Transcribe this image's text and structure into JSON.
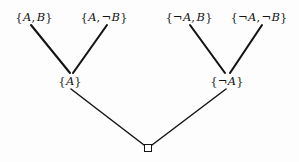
{
  "diagram": {
    "type": "tree",
    "title": "",
    "background_color": "#fdfdfd",
    "line_color": "#141414",
    "text_color": "#131313",
    "nodes": [
      {
        "id": "ab",
        "level": "top",
        "text": "{A, B}",
        "parts": {
          "open": "{",
          "first": "A",
          "first_neg": "",
          "comma": ",",
          "second": "B",
          "second_neg": "",
          "close": "}"
        },
        "x": 34,
        "y": 17
      },
      {
        "id": "anotb",
        "level": "top",
        "text": "{A, ¬B}",
        "parts": {
          "open": "{",
          "first": "A",
          "first_neg": "",
          "comma": ",",
          "second": "B",
          "second_neg": "¬",
          "close": "}"
        },
        "x": 104,
        "y": 17
      },
      {
        "id": "notab",
        "level": "top",
        "text": "{¬A, B}",
        "parts": {
          "open": "{",
          "first": "A",
          "first_neg": "¬",
          "comma": ",",
          "second": "B",
          "second_neg": "",
          "close": "}"
        },
        "x": 189,
        "y": 17
      },
      {
        "id": "notanotb",
        "level": "top",
        "text": "{¬A, ¬B}",
        "parts": {
          "open": "{",
          "first": "A",
          "first_neg": "¬",
          "comma": ",",
          "second": "B",
          "second_neg": "¬",
          "close": "}"
        },
        "x": 259,
        "y": 17
      },
      {
        "id": "a",
        "level": "middle",
        "text": "{A}",
        "parts": {
          "open": "{",
          "first": "A",
          "first_neg": "",
          "comma": "",
          "second": "",
          "second_neg": "",
          "close": "}"
        },
        "x": 70,
        "y": 81
      },
      {
        "id": "nota",
        "level": "middle",
        "text": "{¬A}",
        "parts": {
          "open": "{",
          "first": "A",
          "first_neg": "¬",
          "comma": "",
          "second": "",
          "second_neg": "",
          "close": "}"
        },
        "x": 227,
        "y": 81
      },
      {
        "id": "empty",
        "level": "bottom",
        "text": "",
        "icon": "empty-set-square",
        "x": 148,
        "y": 148
      }
    ],
    "edges": [
      {
        "from": "ab",
        "to": "a",
        "x1": 31,
        "y1": 25,
        "x2": 70,
        "y2": 73
      },
      {
        "from": "anotb",
        "to": "a",
        "x1": 107,
        "y1": 25,
        "x2": 73,
        "y2": 73
      },
      {
        "from": "notab",
        "to": "nota",
        "x1": 190,
        "y1": 25,
        "x2": 225,
        "y2": 73
      },
      {
        "from": "notanotb",
        "to": "nota",
        "x1": 262,
        "y1": 25,
        "x2": 230,
        "y2": 73
      },
      {
        "from": "a",
        "to": "empty",
        "x1": 71,
        "y1": 89,
        "x2": 144,
        "y2": 145
      },
      {
        "from": "nota",
        "to": "empty",
        "x1": 226,
        "y1": 89,
        "x2": 152,
        "y2": 145
      }
    ]
  }
}
